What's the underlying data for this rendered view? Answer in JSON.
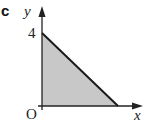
{
  "figure": {
    "part_label": "c",
    "y_axis_label": "y",
    "x_axis_label": "x",
    "origin_label": "O",
    "y_intercept_label": "4"
  },
  "region": {
    "description": "Shaded triangular region bounded by the y-axis, x-axis and a line from (0,4) down to the x-axis",
    "vertices": [
      [
        0,
        0
      ],
      [
        0,
        4
      ],
      [
        4,
        0
      ]
    ],
    "fill_color": "#c8c8c8",
    "edge_color": "#1a1a1a"
  },
  "colors": {
    "axis": "#222222",
    "background": "#ffffff"
  }
}
